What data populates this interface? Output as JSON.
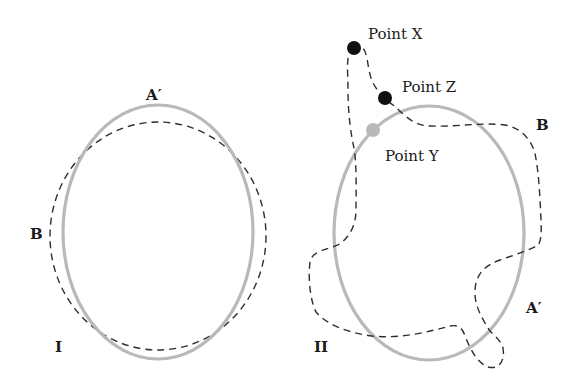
{
  "diagram": {
    "panels": [
      {
        "id": "I",
        "label": "I",
        "curves": [
          {
            "name": "A′",
            "style": "solid-gray",
            "label": "A′"
          },
          {
            "name": "B",
            "style": "dashed-black",
            "label": "B"
          }
        ]
      },
      {
        "id": "II",
        "label": "II",
        "curves": [
          {
            "name": "A′",
            "style": "solid-gray",
            "label": "A′"
          },
          {
            "name": "B",
            "style": "dashed-black",
            "label": "B"
          }
        ],
        "points": [
          {
            "label": "Point X",
            "color": "#111111"
          },
          {
            "label": "Point Z",
            "color": "#111111"
          },
          {
            "label": "Point Y",
            "color": "#b9b9b9"
          }
        ]
      }
    ],
    "colors": {
      "gray_curve": "#b9b9b9",
      "dashed_curve": "#2e2e2e",
      "black_point": "#111111",
      "gray_point": "#b9b9b9"
    }
  }
}
